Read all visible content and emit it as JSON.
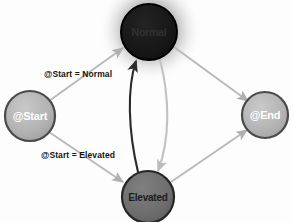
{
  "diagram": {
    "background_color": "#fdfdfd",
    "nodes": [
      {
        "id": "start",
        "label": "@Start",
        "cx": 30,
        "cy": 116,
        "r": 25,
        "fill": "#b0b0b0",
        "stroke": "#4a4a4a",
        "text_color": "#ffffff",
        "font_size": 11
      },
      {
        "id": "normal",
        "label": "Normal",
        "cx": 149,
        "cy": 32,
        "r": 28,
        "fill": "#171717",
        "stroke": "#000000",
        "text_color": "#2e2e2e",
        "font_size": 10.5
      },
      {
        "id": "elevated",
        "label": "Elevated",
        "cx": 148,
        "cy": 197,
        "r": 26,
        "fill": "#6e6e6e",
        "stroke": "#262626",
        "text_color": "#1c1c1c",
        "font_size": 10
      },
      {
        "id": "end",
        "label": "@End",
        "cx": 265,
        "cy": 115,
        "r": 23,
        "fill": "#b4b4b4",
        "stroke": "#4a4a4a",
        "text_color": "#ffffff",
        "font_size": 11
      }
    ],
    "edges": [
      {
        "id": "start-to-normal",
        "from": "start",
        "to": "normal",
        "label": "@Start = Normal",
        "color": "#b9b9b9"
      },
      {
        "id": "start-to-elevated",
        "from": "start",
        "to": "elevated",
        "label": "@Start = Elevated",
        "color": "#b9b9b9"
      },
      {
        "id": "elevated-to-normal",
        "from": "elevated",
        "to": "normal",
        "label": "",
        "color": "#2b2b2b"
      },
      {
        "id": "normal-to-elevated",
        "from": "normal",
        "to": "elevated",
        "label": "",
        "color": "#c2c2c2"
      },
      {
        "id": "normal-to-end",
        "from": "normal",
        "to": "end",
        "label": "",
        "color": "#b9b9b9"
      },
      {
        "id": "elevated-to-end",
        "from": "elevated",
        "to": "end",
        "label": "",
        "color": "#b9b9b9"
      }
    ]
  }
}
